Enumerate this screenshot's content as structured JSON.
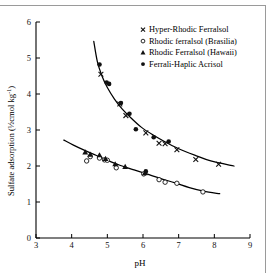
{
  "chart_data": {
    "type": "scatter",
    "title": "",
    "xlabel": "pH",
    "ylabel": "Sulfate adsorption (½cmol kg",
    "ylabel_sup": "-1",
    "ylabel_close": ")",
    "xlim": [
      3,
      9
    ],
    "ylim": [
      0,
      6
    ],
    "xticks": [
      3,
      4,
      5,
      6,
      7,
      8,
      9
    ],
    "yticks": [
      0,
      1,
      2,
      3,
      4,
      5,
      6
    ],
    "grid": false,
    "legend_position": "top-right",
    "series": [
      {
        "name": "Hyper-Rhodic Ferralsol",
        "marker": "cross",
        "curve": "upper",
        "points": [
          [
            4.82,
            4.55
          ],
          [
            5.35,
            3.72
          ],
          [
            5.52,
            3.4
          ],
          [
            6.08,
            2.92
          ],
          [
            6.45,
            2.63
          ],
          [
            6.62,
            2.62
          ],
          [
            6.95,
            2.45
          ],
          [
            7.48,
            2.18
          ],
          [
            8.12,
            2.05
          ]
        ]
      },
      {
        "name": "Rhodic ferralsol (Brasilia)",
        "marker": "open-circle",
        "curve": "lower",
        "points": [
          [
            4.42,
            2.14
          ],
          [
            4.52,
            2.26
          ],
          [
            4.78,
            2.22
          ],
          [
            4.92,
            2.17
          ],
          [
            5.0,
            2.16
          ],
          [
            5.25,
            1.95
          ],
          [
            6.02,
            1.78
          ],
          [
            6.45,
            1.62
          ],
          [
            6.62,
            1.55
          ],
          [
            6.95,
            1.52
          ],
          [
            7.68,
            1.28
          ]
        ]
      },
      {
        "name": "Rhodic Ferralsol (Hawaii)",
        "marker": "triangle",
        "curve": "lower",
        "points": [
          [
            4.38,
            2.38
          ],
          [
            4.52,
            2.32
          ],
          [
            4.78,
            2.3
          ],
          [
            4.95,
            2.2
          ],
          [
            5.22,
            2.05
          ],
          [
            5.5,
            1.98
          ],
          [
            6.05,
            1.8
          ]
        ]
      },
      {
        "name": "Ferrali-Haplic Acrisol",
        "marker": "filled-circle",
        "curve": "upper",
        "points": [
          [
            4.78,
            4.82
          ],
          [
            4.98,
            4.32
          ],
          [
            5.05,
            4.28
          ],
          [
            5.38,
            3.75
          ],
          [
            5.62,
            3.45
          ],
          [
            5.8,
            3.02
          ],
          [
            6.3,
            2.8
          ],
          [
            6.72,
            2.68
          ],
          [
            6.08,
            1.85
          ]
        ]
      }
    ],
    "fitted_curves": [
      {
        "name": "upper-fit",
        "points": [
          [
            4.62,
            5.46
          ],
          [
            4.72,
            4.9
          ],
          [
            4.85,
            4.5
          ],
          [
            5.0,
            4.18
          ],
          [
            5.2,
            3.86
          ],
          [
            5.42,
            3.58
          ],
          [
            5.68,
            3.32
          ],
          [
            5.95,
            3.08
          ],
          [
            6.25,
            2.88
          ],
          [
            6.6,
            2.68
          ],
          [
            7.0,
            2.48
          ],
          [
            7.45,
            2.3
          ],
          [
            7.9,
            2.14
          ],
          [
            8.55,
            2.0
          ]
        ]
      },
      {
        "name": "lower-fit",
        "points": [
          [
            3.78,
            2.72
          ],
          [
            4.05,
            2.58
          ],
          [
            4.35,
            2.44
          ],
          [
            4.68,
            2.3
          ],
          [
            5.0,
            2.16
          ],
          [
            5.35,
            2.02
          ],
          [
            5.72,
            1.9
          ],
          [
            6.1,
            1.78
          ],
          [
            6.5,
            1.65
          ],
          [
            6.9,
            1.53
          ],
          [
            7.3,
            1.4
          ],
          [
            7.7,
            1.3
          ],
          [
            8.15,
            1.23
          ]
        ]
      }
    ]
  },
  "legend": {
    "items": [
      {
        "marker": "cross",
        "label": "Hyper-Rhodic Ferralsol"
      },
      {
        "marker": "open-circle",
        "label": "Rhodic ferralsol (Brasilia)"
      },
      {
        "marker": "triangle",
        "label": "Rhodic Ferralsol (Hawaii)"
      },
      {
        "marker": "filled-circle",
        "label": "Ferrali-Haplic Acrisol"
      }
    ]
  },
  "axes": {
    "x_title": "pH",
    "y_title_main": "Sulfate adsorption (½cmol kg",
    "y_title_sup": "-1",
    "y_title_tail": ")",
    "x_tick_labels": [
      "3",
      "4",
      "5",
      "6",
      "7",
      "8",
      "9"
    ],
    "y_tick_labels": [
      "0",
      "1",
      "2",
      "3",
      "4",
      "5",
      "6"
    ]
  },
  "colors": {
    "ink": "#000000",
    "frame_rule": "#9a9a9a",
    "background": "#ffffff"
  }
}
